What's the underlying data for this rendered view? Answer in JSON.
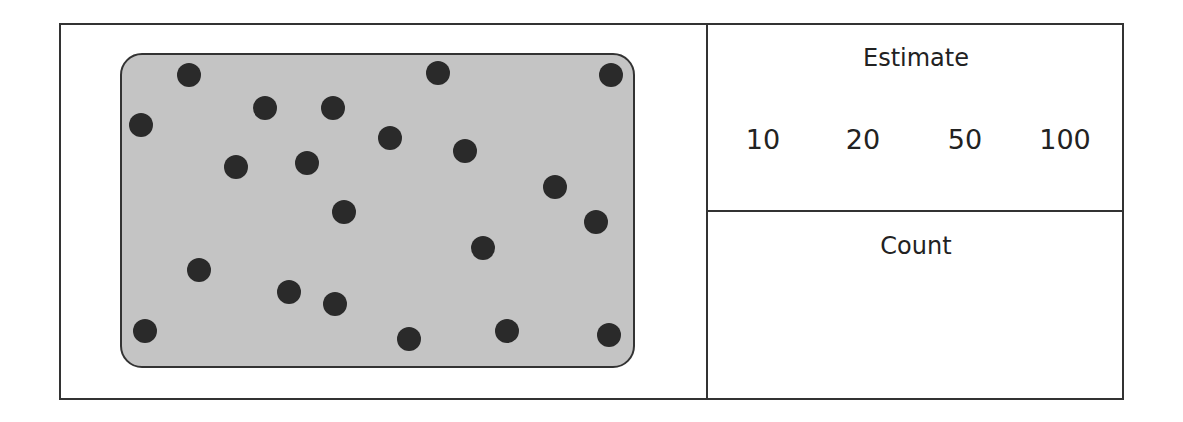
{
  "estimate": {
    "title": "Estimate",
    "options": [
      "10",
      "20",
      "50",
      "100"
    ]
  },
  "count": {
    "title": "Count",
    "value": ""
  },
  "dot_panel": {
    "dot_count": 21,
    "fill_color": "#c4c4c4",
    "dot_color": "#2a2a2a",
    "dots": [
      [
        189,
        75
      ],
      [
        438,
        73
      ],
      [
        611,
        75
      ],
      [
        141,
        125
      ],
      [
        265,
        108
      ],
      [
        333,
        108
      ],
      [
        390,
        138
      ],
      [
        465,
        151
      ],
      [
        236,
        167
      ],
      [
        307,
        163
      ],
      [
        555,
        187
      ],
      [
        344,
        212
      ],
      [
        596,
        222
      ],
      [
        483,
        248
      ],
      [
        199,
        270
      ],
      [
        289,
        292
      ],
      [
        335,
        304
      ],
      [
        145,
        331
      ],
      [
        409,
        339
      ],
      [
        507,
        331
      ],
      [
        609,
        335
      ]
    ]
  }
}
